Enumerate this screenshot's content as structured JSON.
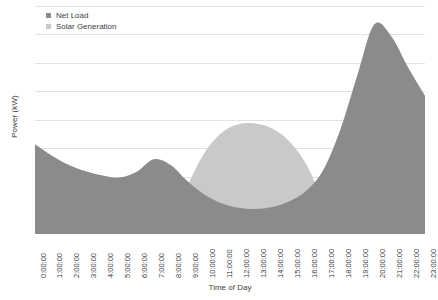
{
  "chart_data": {
    "type": "area",
    "title": "",
    "xlabel": "Time of Day",
    "ylabel": "Power (kW)",
    "grid": true,
    "legend_position": "top-left-inside",
    "xlim": [
      0,
      23
    ],
    "ylim": [
      0,
      8
    ],
    "gridlines": [
      1,
      2,
      3,
      4,
      5,
      6,
      7,
      8
    ],
    "colors": {
      "net_load": "#8b8b8b",
      "solar_generation": "#c9c9c9",
      "gridline": "#e2e2e2",
      "axis_text": "#3d3d3d",
      "background": "#ffffff"
    },
    "categories": [
      "0:00:00",
      "1:00:00",
      "2:00:00",
      "3:00:00",
      "4:00:00",
      "5:00:00",
      "6:00:00",
      "7:00:00",
      "8:00:00",
      "9:00:00",
      "10:00:00",
      "11:00:00",
      "12:00:00",
      "13:00:00",
      "14:00:00",
      "15:00:00",
      "16:00:00",
      "17:00:00",
      "18:00:00",
      "19:00:00",
      "20:00:00",
      "21:00:00",
      "22:00:00",
      "23:00:00"
    ],
    "x": [
      0,
      1,
      2,
      3,
      4,
      5,
      6,
      7,
      8,
      9,
      10,
      11,
      12,
      13,
      14,
      15,
      16,
      17,
      18,
      19,
      20,
      21,
      22,
      23
    ],
    "series": [
      {
        "name": "Net Load",
        "color": "#8b8b8b",
        "values": [
          3.15,
          2.75,
          2.42,
          2.2,
          2.05,
          1.98,
          2.18,
          2.62,
          2.42,
          1.85,
          1.38,
          1.08,
          0.92,
          0.88,
          0.95,
          1.15,
          1.52,
          2.25,
          3.65,
          5.55,
          7.35,
          6.95,
          5.85,
          4.85
        ]
      },
      {
        "name": "Solar Generation",
        "color": "#c9c9c9",
        "values": [
          0,
          0,
          0,
          0,
          0,
          0,
          0,
          0,
          0.35,
          1.7,
          2.85,
          3.55,
          3.85,
          3.88,
          3.7,
          3.25,
          2.45,
          1.15,
          0.05,
          0,
          0,
          0,
          0,
          0
        ]
      }
    ]
  },
  "legend": {
    "items": [
      {
        "label": "Net Load",
        "color": "#8b8b8b"
      },
      {
        "label": "Solar Generation",
        "color": "#c9c9c9"
      }
    ]
  },
  "axes": {
    "x_title": "Time of Day",
    "y_title": "Power (kW)"
  }
}
